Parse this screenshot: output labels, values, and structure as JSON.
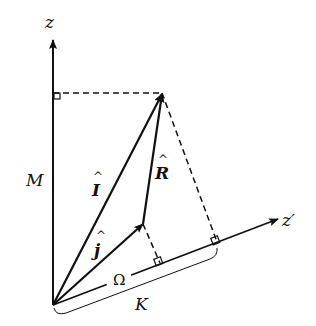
{
  "diagram": {
    "labels": {
      "z_axis": "z",
      "z_prime_axis": "z′",
      "M": "M",
      "K": "K",
      "Omega": "Ω",
      "I_hat": "I",
      "J_hat": "j",
      "R_hat": "R",
      "hat": "^"
    },
    "colors": {
      "ink": "#111111",
      "background": "#ffffff"
    }
  }
}
